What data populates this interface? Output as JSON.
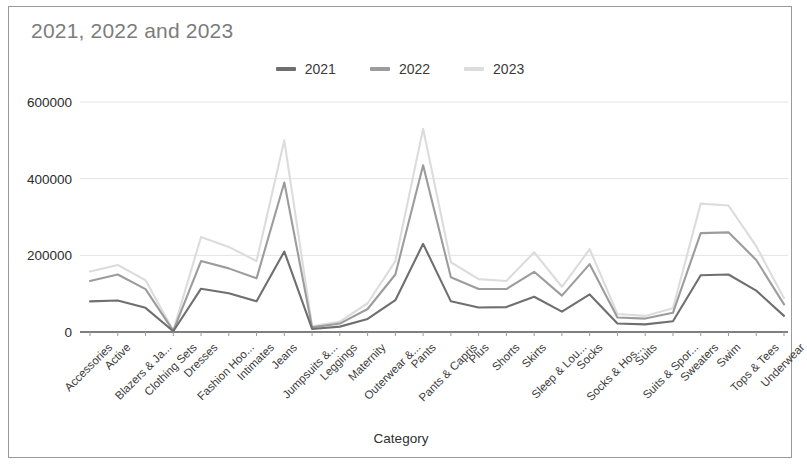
{
  "card": {
    "title": "2021, 2022 and 2023",
    "title_color": "#7c7c7c",
    "border_color": "#9a9a9a",
    "background": "#ffffff"
  },
  "legend": {
    "position": "top-center",
    "entries": [
      {
        "label": "2021",
        "color": "#6f6f6f"
      },
      {
        "label": "2022",
        "color": "#9c9c9c"
      },
      {
        "label": "2023",
        "color": "#dcdcdc"
      }
    ]
  },
  "axes": {
    "x_title": "Category",
    "y_ticks": [
      "0",
      "200000",
      "400000",
      "600000"
    ],
    "y_tick_values": [
      0,
      200000,
      400000,
      600000
    ]
  },
  "chart_data": {
    "type": "line",
    "title": "2021, 2022 and 2023",
    "xlabel": "Category",
    "ylabel": "",
    "ylim": [
      0,
      650000
    ],
    "grid": true,
    "legend_position": "top-center",
    "categories": [
      "Accessories",
      "Active",
      "Blazers & Ja...",
      "Clothing Sets",
      "Dresses",
      "Fashion Hoo...",
      "Intimates",
      "Jeans",
      "Jumpsuits &...",
      "Leggings",
      "Maternity",
      "Outerwear &...",
      "Pants",
      "Pants & Capris",
      "Plus",
      "Shorts",
      "Skirts",
      "Sleep & Lou...",
      "Socks",
      "Socks & Hos...",
      "Suits",
      "Suits & Spor...",
      "Sweaters",
      "Swim",
      "Tops & Tees",
      "Underwear"
    ],
    "series": [
      {
        "name": "2021",
        "color": "#6f6f6f",
        "values": [
          80000,
          82000,
          63000,
          2000,
          113000,
          101000,
          80000,
          210000,
          8000,
          14000,
          34000,
          83000,
          230000,
          80000,
          64000,
          65000,
          92000,
          53000,
          98000,
          22000,
          20000,
          28000,
          148000,
          150000,
          108000,
          42000
        ]
      },
      {
        "name": "2022",
        "color": "#9c9c9c",
        "values": [
          133000,
          150000,
          112000,
          3000,
          185000,
          166000,
          140000,
          390000,
          12000,
          22000,
          60000,
          150000,
          435000,
          143000,
          112000,
          112000,
          157000,
          95000,
          177000,
          38000,
          35000,
          50000,
          258000,
          260000,
          188000,
          72000
        ]
      },
      {
        "name": "2023",
        "color": "#dcdcdc",
        "values": [
          158000,
          175000,
          135000,
          4000,
          248000,
          222000,
          185000,
          500000,
          15000,
          27000,
          75000,
          185000,
          530000,
          182000,
          138000,
          133000,
          208000,
          118000,
          216000,
          47000,
          42000,
          62000,
          335000,
          330000,
          224000,
          88000
        ]
      }
    ]
  }
}
